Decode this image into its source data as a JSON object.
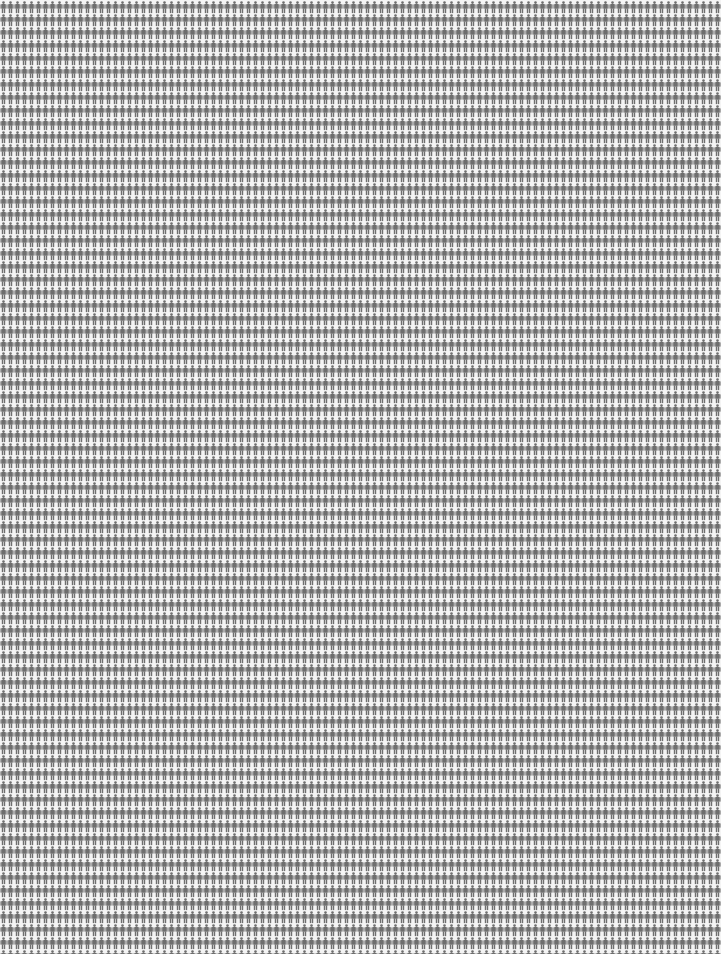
{
  "chart_data": {
    "type": "isotype",
    "title": "",
    "subtitle": "",
    "xlabel": "",
    "ylabel": "",
    "legend": [],
    "icon": "person-icon",
    "icon_color": "#6e6e6e",
    "background_color": "#f4f4f4",
    "columns": 103,
    "rows": 73,
    "cell_width_px": 7,
    "cell_height_px": 13,
    "total_icons": 7519,
    "series": [
      {
        "name": "people",
        "value": 7519,
        "color": "#6e6e6e"
      }
    ],
    "grid": false
  }
}
